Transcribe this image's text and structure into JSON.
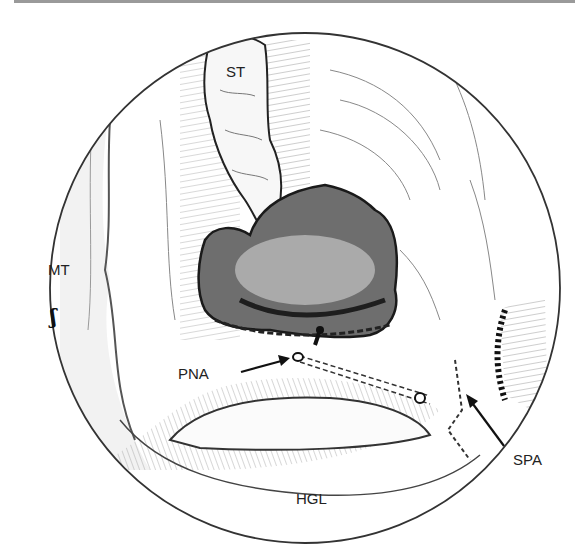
{
  "figure": {
    "type": "surgical illustration",
    "view": "circular endoscopic field",
    "labels": {
      "st": "ST",
      "mt": "MT",
      "pna": "PNA",
      "spa": "SPA",
      "hgl": "HGL"
    },
    "margin_mark": "ʃ",
    "colors": {
      "ink": "#222222",
      "shade": "#6e6e6e",
      "light_shade": "#bdbdbd",
      "background": "#ffffff",
      "top_rule": "#9a9a9a"
    }
  }
}
